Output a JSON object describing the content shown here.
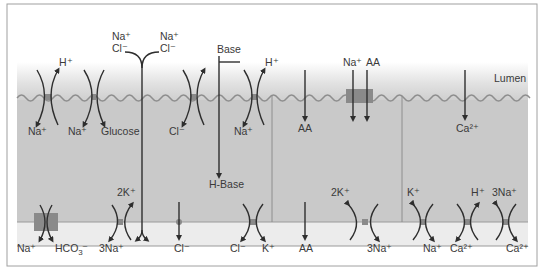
{
  "colors": {
    "background": "#ffffff",
    "frame": "#9a9a9a",
    "cell_fill": "#c9c9c9",
    "lumen_top": "#ffffff",
    "basolateral_fill": "#ececec",
    "membrane_wave": "#8e8e8e",
    "transporter": "#8a8a8a",
    "arrow": "#2e2e2e",
    "text": "#3a3a3a"
  },
  "labels": {
    "lumen": "Lumen"
  },
  "apical_transporters": [
    {
      "id": "nhe",
      "top_label": "H⁺",
      "bottom_labels": [
        "Na⁺"
      ]
    },
    {
      "id": "sglt",
      "bottom_labels": [
        "Na⁺",
        "Glucose"
      ]
    },
    {
      "id": "paracellular",
      "top_labels": [
        "Na⁺",
        "Cl⁻",
        "Na⁺",
        "Cl⁻"
      ]
    },
    {
      "id": "cl-channel",
      "bottom_labels": [
        "Cl⁻"
      ]
    },
    {
      "id": "base",
      "top_label": "Base",
      "bottom_label": "H-Base"
    },
    {
      "id": "nhe2",
      "top_label": "H⁺",
      "bottom_label": "Na⁺"
    },
    {
      "id": "aa",
      "bottom_label": "AA"
    },
    {
      "id": "na-aa",
      "top_labels": [
        "Na⁺",
        "AA"
      ]
    },
    {
      "id": "ca",
      "bottom_label": "Ca²⁺"
    }
  ],
  "basolateral_transporters": [
    {
      "id": "nbc",
      "labels": [
        "Na⁺",
        "HCO₃⁻"
      ]
    },
    {
      "id": "nak-atpase-1",
      "top_label": "2K⁺",
      "bottom_label": "3Na⁺"
    },
    {
      "id": "cl-1",
      "bottom_label": "Cl⁻"
    },
    {
      "id": "kcc",
      "labels": [
        "Cl⁻",
        "K⁺"
      ]
    },
    {
      "id": "aa-out",
      "bottom_label": "AA"
    },
    {
      "id": "nak-atpase-2",
      "top_label": "2K⁺",
      "bottom_label": "3Na⁺"
    },
    {
      "id": "k-na",
      "top_label": "K⁺",
      "bottom_label": "Na⁺"
    },
    {
      "id": "pmca",
      "top_label": "H⁺",
      "bottom_label": "Ca²⁺"
    },
    {
      "id": "ncx",
      "top_label": "3Na⁺",
      "bottom_label": "Ca²⁺"
    }
  ],
  "text": {
    "t_h1": "H⁺",
    "t_na1": "Na⁺",
    "t_na2": "Na⁺",
    "t_glucose": "Glucose",
    "t_nacl_l1": "Na⁺",
    "t_nacl_l2": "Cl⁻",
    "t_nacl_r1": "Na⁺",
    "t_nacl_r2": "Cl⁻",
    "t_cl_ap": "Cl⁻",
    "t_base": "Base",
    "t_hbase": "H-Base",
    "t_h2": "H⁺",
    "t_na3": "Na⁺",
    "t_aa1": "AA",
    "t_na4": "Na⁺",
    "t_aa2": "AA",
    "t_ca1": "Ca²⁺",
    "t_lumen": "Lumen",
    "b_na": "Na⁺",
    "b_hco3": "HCO",
    "b_hco3_sub": "3",
    "b_hco3_sup": "–",
    "b_2k1": "2K⁺",
    "b_3na1": "3Na⁺",
    "b_cl1": "Cl⁻",
    "b_cl2": "Cl⁻",
    "b_k": "K⁺",
    "b_aa": "AA",
    "b_2k2": "2K⁺",
    "b_3na2": "3Na⁺",
    "b_k2": "K⁺",
    "b_na2": "Na⁺",
    "b_h": "H⁺",
    "b_ca1": "Ca²⁺",
    "b_3na3": "3Na⁺",
    "b_ca2": "Ca²⁺"
  }
}
